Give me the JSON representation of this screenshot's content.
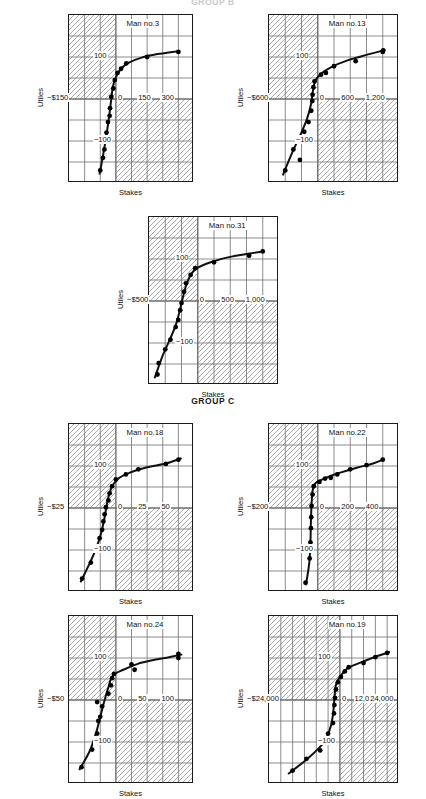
{
  "groups": [
    {
      "id": "group-b",
      "label": "GROUP B",
      "clipped": true
    },
    {
      "id": "group-c",
      "label": "GROUP C",
      "clipped": false
    }
  ],
  "axis_titles": {
    "y": "Utiles",
    "x": "Stakes"
  },
  "style": {
    "line_color": "#111111",
    "grid_color": "#6e6e6e",
    "frame_color": "#1a1a1a",
    "hatch_color": "#8a8a8a",
    "point_color": "#000000",
    "background": "#ffffff"
  },
  "chart_data": [
    {
      "id": "man-3",
      "type": "scatter",
      "title": "Man no.3",
      "group": "GROUP B",
      "xlabel": "Stakes",
      "ylabel": "Utiles",
      "xlim": [
        -225,
        375
      ],
      "ylim": [
        -200,
        200
      ],
      "xticks": [
        -150,
        0,
        150,
        300
      ],
      "xticklabels": [
        "−$150",
        "0",
        "150",
        "300"
      ],
      "yticks": [
        -100,
        100
      ],
      "yticklabels": [
        "−100",
        "100"
      ],
      "grid": true,
      "points": [
        [
          -75,
          -170
        ],
        [
          -62,
          -140
        ],
        [
          -55,
          -120
        ],
        [
          -45,
          -80
        ],
        [
          -38,
          -55
        ],
        [
          -30,
          -40
        ],
        [
          -28,
          -22
        ],
        [
          -22,
          5
        ],
        [
          -12,
          25
        ],
        [
          -5,
          45
        ],
        [
          8,
          62
        ],
        [
          25,
          72
        ],
        [
          50,
          85
        ],
        [
          150,
          100
        ],
        [
          300,
          112
        ]
      ],
      "curve": [
        [
          -78,
          -178
        ],
        [
          -60,
          -130
        ],
        [
          -45,
          -85
        ],
        [
          -32,
          -40
        ],
        [
          -22,
          0
        ],
        [
          -14,
          30
        ],
        [
          0,
          52
        ],
        [
          25,
          72
        ],
        [
          60,
          86
        ],
        [
          120,
          98
        ],
        [
          200,
          107
        ],
        [
          300,
          114
        ]
      ]
    },
    {
      "id": "man-13",
      "type": "scatter",
      "title": "Man no.13",
      "group": "GROUP B",
      "xlabel": "Stakes",
      "ylabel": "Utiles",
      "xlim": [
        -900,
        1500
      ],
      "ylim": [
        -200,
        200
      ],
      "xticks": [
        -600,
        0,
        600,
        1200
      ],
      "xticklabels": [
        "−$600",
        "0",
        "600",
        "1,200"
      ],
      "yticks": [
        -100,
        100
      ],
      "yticklabels": [
        "−100",
        "100"
      ],
      "grid": true,
      "points": [
        [
          -600,
          -170
        ],
        [
          -450,
          -120
        ],
        [
          -330,
          -145
        ],
        [
          -250,
          -78
        ],
        [
          -170,
          -55
        ],
        [
          -120,
          -28
        ],
        [
          -100,
          -5
        ],
        [
          -95,
          10
        ],
        [
          -80,
          28
        ],
        [
          -60,
          42
        ],
        [
          60,
          58
        ],
        [
          150,
          62
        ],
        [
          300,
          78
        ],
        [
          700,
          90
        ],
        [
          1200,
          112
        ],
        [
          1210,
          116
        ]
      ],
      "curve": [
        [
          -640,
          -180
        ],
        [
          -480,
          -130
        ],
        [
          -330,
          -88
        ],
        [
          -200,
          -48
        ],
        [
          -120,
          -10
        ],
        [
          -90,
          18
        ],
        [
          -50,
          42
        ],
        [
          60,
          60
        ],
        [
          250,
          76
        ],
        [
          550,
          92
        ],
        [
          900,
          105
        ],
        [
          1220,
          116
        ]
      ]
    },
    {
      "id": "man-31",
      "type": "scatter",
      "title": "Man no.31",
      "group": "GROUP B",
      "xlabel": "Stakes",
      "ylabel": "Utiles",
      "xlim": [
        -750,
        1250
      ],
      "ylim": [
        -200,
        200
      ],
      "xticks": [
        -500,
        0,
        500,
        1000
      ],
      "xticklabels": [
        "−$500",
        "0",
        "500",
        "1,000"
      ],
      "yticks": [
        -100,
        100
      ],
      "yticklabels": [
        "−100",
        "100"
      ],
      "grid": true,
      "points": [
        [
          -620,
          -175
        ],
        [
          -600,
          -148
        ],
        [
          -500,
          -115
        ],
        [
          -420,
          -92
        ],
        [
          -340,
          -62
        ],
        [
          -300,
          -45
        ],
        [
          -270,
          -22
        ],
        [
          -250,
          -5
        ],
        [
          -210,
          22
        ],
        [
          -180,
          42
        ],
        [
          -110,
          62
        ],
        [
          -40,
          78
        ],
        [
          250,
          92
        ],
        [
          790,
          108
        ],
        [
          1000,
          118
        ]
      ],
      "curve": [
        [
          -660,
          -182
        ],
        [
          -540,
          -130
        ],
        [
          -430,
          -92
        ],
        [
          -340,
          -58
        ],
        [
          -280,
          -25
        ],
        [
          -230,
          8
        ],
        [
          -160,
          45
        ],
        [
          -40,
          75
        ],
        [
          250,
          95
        ],
        [
          560,
          107
        ],
        [
          800,
          113
        ],
        [
          1010,
          118
        ]
      ]
    },
    {
      "id": "man-18",
      "type": "scatter",
      "title": "Man no.18",
      "group": "GROUP C",
      "xlabel": "Stakes",
      "ylabel": "Utiles",
      "xlim": [
        -37.5,
        62.5
      ],
      "ylim": [
        -200,
        200
      ],
      "xticks": [
        -25,
        0,
        25,
        50
      ],
      "xticklabels": [
        "−$25",
        "0",
        "25",
        "50"
      ],
      "yticks": [
        -100,
        100
      ],
      "yticklabels": [
        "−100",
        "100"
      ],
      "grid": true,
      "points": [
        [
          -27,
          -168
        ],
        [
          -20,
          -130
        ],
        [
          -16,
          -100
        ],
        [
          -13,
          -72
        ],
        [
          -11,
          -52
        ],
        [
          -10,
          -32
        ],
        [
          -9,
          -15
        ],
        [
          -8,
          2
        ],
        [
          -6,
          18
        ],
        [
          -5,
          35
        ],
        [
          -3,
          52
        ],
        [
          0,
          68
        ],
        [
          8,
          80
        ],
        [
          18,
          92
        ],
        [
          40,
          105
        ],
        [
          50,
          115
        ]
      ],
      "curve": [
        [
          -28,
          -175
        ],
        [
          -21,
          -132
        ],
        [
          -16,
          -98
        ],
        [
          -12,
          -62
        ],
        [
          -9,
          -22
        ],
        [
          -7,
          12
        ],
        [
          -4,
          45
        ],
        [
          2,
          70
        ],
        [
          12,
          85
        ],
        [
          25,
          97
        ],
        [
          40,
          106
        ],
        [
          52,
          118
        ]
      ]
    },
    {
      "id": "man-22",
      "type": "scatter",
      "title": "Man no.22",
      "group": "GROUP C",
      "xlabel": "Stakes",
      "ylabel": "Utiles",
      "xlim": [
        -300,
        500
      ],
      "ylim": [
        -200,
        200
      ],
      "xticks": [
        -200,
        0,
        200,
        400
      ],
      "xticklabels": [
        "−$200",
        "0",
        "200",
        "400"
      ],
      "yticks": [
        -100,
        100
      ],
      "yticklabels": [
        "−100",
        "100"
      ],
      "grid": true,
      "points": [
        [
          -75,
          -178
        ],
        [
          -50,
          -120
        ],
        [
          -45,
          -82
        ],
        [
          -42,
          -48
        ],
        [
          -40,
          -22
        ],
        [
          -38,
          5
        ],
        [
          -32,
          32
        ],
        [
          -25,
          52
        ],
        [
          10,
          62
        ],
        [
          45,
          70
        ],
        [
          80,
          72
        ],
        [
          120,
          80
        ],
        [
          200,
          92
        ],
        [
          300,
          102
        ],
        [
          400,
          115
        ]
      ],
      "curve": [
        [
          -72,
          -182
        ],
        [
          -52,
          -130
        ],
        [
          -45,
          -80
        ],
        [
          -42,
          -32
        ],
        [
          -38,
          10
        ],
        [
          -30,
          45
        ],
        [
          -12,
          60
        ],
        [
          40,
          70
        ],
        [
          120,
          82
        ],
        [
          240,
          96
        ],
        [
          340,
          106
        ],
        [
          405,
          116
        ]
      ]
    },
    {
      "id": "man-24",
      "type": "scatter",
      "title": "Man no.24",
      "group": "GROUP C",
      "xlabel": "Stakes",
      "ylabel": "Utiles",
      "xlim": [
        -75,
        125
      ],
      "ylim": [
        -200,
        200
      ],
      "xticks": [
        -50,
        0,
        50,
        100
      ],
      "xticklabels": [
        "−$50",
        "0",
        "50",
        "100"
      ],
      "yticks": [
        -100,
        100
      ],
      "yticklabels": [
        "−100",
        "100"
      ],
      "grid": true,
      "points": [
        [
          -55,
          -160
        ],
        [
          -38,
          -118
        ],
        [
          -30,
          -80
        ],
        [
          -28,
          -50
        ],
        [
          -25,
          -40
        ],
        [
          -22,
          -15
        ],
        [
          -30,
          -5
        ],
        [
          -12,
          15
        ],
        [
          -8,
          35
        ],
        [
          -6,
          52
        ],
        [
          -3,
          62
        ],
        [
          25,
          85
        ],
        [
          30,
          72
        ],
        [
          100,
          100
        ],
        [
          100,
          110
        ]
      ],
      "curve": [
        [
          -58,
          -165
        ],
        [
          -42,
          -122
        ],
        [
          -32,
          -80
        ],
        [
          -25,
          -40
        ],
        [
          -18,
          0
        ],
        [
          -12,
          30
        ],
        [
          -5,
          58
        ],
        [
          12,
          72
        ],
        [
          35,
          86
        ],
        [
          60,
          95
        ],
        [
          85,
          102
        ],
        [
          105,
          108
        ]
      ]
    },
    {
      "id": "man-19",
      "type": "scatter",
      "title": "Man no.19",
      "group": "GROUP C",
      "xlabel": "Stakes",
      "ylabel": "Utiles",
      "xlim": [
        -36000,
        30000
      ],
      "ylim": [
        -200,
        200
      ],
      "xticks": [
        -24000,
        0,
        12000,
        24000
      ],
      "xticklabels": [
        "−$24,000",
        "0",
        "12,000",
        "24,000"
      ],
      "yticks": [
        -100,
        100
      ],
      "yticklabels": [
        "−100",
        "100"
      ],
      "grid": true,
      "points": [
        [
          -24000,
          -168
        ],
        [
          -17000,
          -140
        ],
        [
          -10000,
          -120
        ],
        [
          -6000,
          -80
        ],
        [
          -3500,
          -55
        ],
        [
          -3000,
          -32
        ],
        [
          -2800,
          -12
        ],
        [
          -2500,
          5
        ],
        [
          -2000,
          25
        ],
        [
          -1000,
          42
        ],
        [
          500,
          55
        ],
        [
          2500,
          68
        ],
        [
          4500,
          78
        ],
        [
          12000,
          88
        ],
        [
          18000,
          102
        ],
        [
          24000,
          112
        ]
      ],
      "curve": [
        [
          -26000,
          -175
        ],
        [
          -16000,
          -138
        ],
        [
          -8000,
          -100
        ],
        [
          -4500,
          -60
        ],
        [
          -3200,
          -20
        ],
        [
          -2600,
          15
        ],
        [
          -1800,
          40
        ],
        [
          500,
          58
        ],
        [
          4000,
          76
        ],
        [
          11000,
          90
        ],
        [
          18000,
          103
        ],
        [
          25000,
          114
        ]
      ]
    }
  ]
}
